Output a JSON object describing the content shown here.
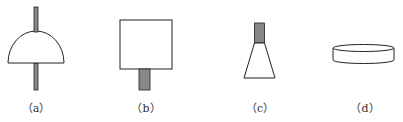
{
  "figure": {
    "panels": [
      {
        "id": "a",
        "label": "（a）",
        "shape": "half-dome with vertical rod through center"
      },
      {
        "id": "b",
        "label": "（b）",
        "shape": "square with short gray stem below"
      },
      {
        "id": "c",
        "label": "（c）",
        "shape": "trapezoid (cone) with gray block on top"
      },
      {
        "id": "d",
        "label": "（d）",
        "shape": "flat cylinder / disc"
      }
    ],
    "colors": {
      "stroke": "#222222",
      "fill": "#ffffff",
      "rod": "#888888"
    }
  }
}
